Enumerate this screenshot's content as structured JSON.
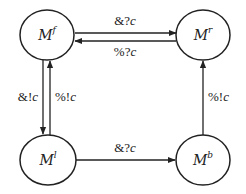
{
  "diagram": {
    "nodes": [
      {
        "id": "Mf",
        "base": "M",
        "sup": "f",
        "cx": 48,
        "cy": 35
      },
      {
        "id": "Mr",
        "base": "M",
        "sup": "r",
        "cx": 203,
        "cy": 35
      },
      {
        "id": "Ml",
        "base": "M",
        "sup": "l",
        "cx": 48,
        "cy": 160
      },
      {
        "id": "Mb",
        "base": "M",
        "sup": "b",
        "cx": 203,
        "cy": 160
      }
    ],
    "edges": [
      {
        "from": "Mf",
        "to": "Mr",
        "prefix": "&?",
        "var": "c"
      },
      {
        "from": "Mr",
        "to": "Mf",
        "prefix": "%?",
        "var": "c"
      },
      {
        "from": "Mf",
        "to": "Ml",
        "prefix": "&!",
        "var": "c"
      },
      {
        "from": "Ml",
        "to": "Mf",
        "prefix": "%!",
        "var": "c"
      },
      {
        "from": "Ml",
        "to": "Mb",
        "prefix": "&?",
        "var": "c"
      },
      {
        "from": "Mb",
        "to": "Mr",
        "prefix": "%!",
        "var": "c"
      }
    ],
    "colors": {
      "stroke": "#222222",
      "background": "#ffffff"
    }
  }
}
